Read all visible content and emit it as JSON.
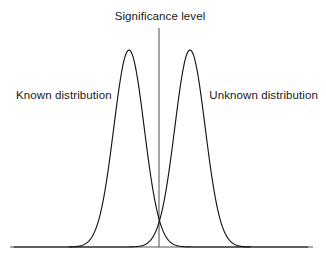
{
  "figure": {
    "width": 326,
    "height": 261,
    "background": "#ffffff",
    "title": "Significance level",
    "labels": {
      "left_curve": "Known distribution",
      "right_curve": "Unknown distribution"
    },
    "colors": {
      "curve_stroke": "#161616",
      "baseline_stroke": "#8d8d8d",
      "significance_line": "#4a4a4a",
      "text": "#1a1a1a"
    }
  },
  "chart_data": {
    "type": "line",
    "title": "Significance level",
    "xlabel": "",
    "ylabel": "",
    "grid": false,
    "legend": "inline-annotations",
    "axis": {
      "baseline_y_px": 247,
      "baseline_x_start_px": 10,
      "baseline_x_end_px": 313,
      "y_axis_visible": false,
      "x_tick_labels": [],
      "y_tick_labels": []
    },
    "annotations": [
      {
        "name": "significance-level-title",
        "text": "Significance level",
        "x_px": 160,
        "y_px": 20,
        "anchor": "middle"
      },
      {
        "name": "known-distribution-label",
        "text": "Known distribution",
        "x_px": 16,
        "y_px": 99,
        "anchor": "start"
      },
      {
        "name": "unknown-distribution-label",
        "text": "Unknown distribution",
        "x_px": 318,
        "y_px": 99,
        "anchor": "end"
      }
    ],
    "vertical_line": {
      "name": "significance-threshold",
      "x_px": 159,
      "y_top_px": 28,
      "y_bottom_px": 247
    },
    "series": [
      {
        "name": "Known distribution",
        "shape": "gaussian",
        "mean_px": 129,
        "sigma_px": 15.2,
        "peak_y_px": 50,
        "baseline_y_px": 247,
        "amplitude_px": 197,
        "x_domain_px": [
          14,
          250
        ]
      },
      {
        "name": "Unknown distribution",
        "shape": "gaussian",
        "mean_px": 190,
        "sigma_px": 15.2,
        "peak_y_px": 50,
        "baseline_y_px": 247,
        "amplitude_px": 197,
        "x_domain_px": [
          70,
          308
        ]
      }
    ],
    "intersection_px": {
      "x": 159.5,
      "y": 228
    }
  }
}
